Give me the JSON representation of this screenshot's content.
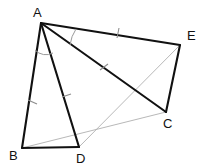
{
  "figure": {
    "width": 205,
    "height": 168,
    "background_color": "#ffffff"
  },
  "style": {
    "main_stroke_color": "#111111",
    "aux_stroke_color": "#b0b0b0",
    "tick_color": "#8d8d8d",
    "arc_color": "#9a9a9a",
    "label_color": "#111111"
  },
  "vertices": [
    {
      "id": "A",
      "label": "A",
      "x": 41,
      "y": 23,
      "label_x": 33,
      "label_y": 17
    },
    {
      "id": "B",
      "label": "B",
      "x": 22,
      "y": 148,
      "label_x": 9,
      "label_y": 160
    },
    {
      "id": "D",
      "label": "D",
      "x": 79,
      "y": 147,
      "label_x": 76,
      "label_y": 163
    },
    {
      "id": "C",
      "label": "C",
      "x": 166,
      "y": 112,
      "label_x": 163,
      "label_y": 128
    },
    {
      "id": "E",
      "label": "E",
      "x": 180,
      "y": 45,
      "label_x": 187,
      "label_y": 40
    }
  ],
  "segments_main": [
    {
      "id": "AB",
      "from": "A",
      "to": "B",
      "x1": 41,
      "y1": 23,
      "x2": 22,
      "y2": 148
    },
    {
      "id": "AD",
      "from": "A",
      "to": "D",
      "x1": 41,
      "y1": 23,
      "x2": 79,
      "y2": 147
    },
    {
      "id": "BD",
      "from": "B",
      "to": "D",
      "x1": 22,
      "y1": 148,
      "x2": 79,
      "y2": 147
    },
    {
      "id": "AE",
      "from": "A",
      "to": "E",
      "x1": 41,
      "y1": 23,
      "x2": 180,
      "y2": 45
    },
    {
      "id": "AC",
      "from": "A",
      "to": "C",
      "x1": 41,
      "y1": 23,
      "x2": 166,
      "y2": 112
    },
    {
      "id": "EC",
      "from": "E",
      "to": "C",
      "x1": 180,
      "y1": 45,
      "x2": 166,
      "y2": 112
    }
  ],
  "segments_auxiliary": [
    {
      "id": "BC",
      "from": "B",
      "to": "C",
      "x1": 22,
      "y1": 148,
      "x2": 166,
      "y2": 112
    },
    {
      "id": "DE",
      "from": "D",
      "to": "E",
      "x1": 79,
      "y1": 147,
      "x2": 180,
      "y2": 45
    }
  ],
  "tick_marks": [
    {
      "id": "tick-AB",
      "on": "AB",
      "x1": 28,
      "y1": 100,
      "x2": 37,
      "y2": 104
    },
    {
      "id": "tick-AD",
      "on": "AD",
      "x1": 62,
      "y1": 97,
      "x2": 71,
      "y2": 94
    },
    {
      "id": "tick-AE",
      "on": "AE",
      "x1": 119,
      "y1": 28,
      "x2": 117,
      "y2": 38
    },
    {
      "id": "tick-AC",
      "on": "AC",
      "x1": 100,
      "y1": 70,
      "x2": 108,
      "y2": 64
    }
  ],
  "angle_arcs": [
    {
      "id": "arc-BAD",
      "at": "A",
      "between": [
        "AB",
        "AD"
      ],
      "path": "M 35 50 A 15 15 0 0 0 53 53"
    },
    {
      "id": "arc-EAC",
      "at": "A",
      "between": [
        "AE",
        "AC"
      ],
      "path": "M 76 29 A 38 38 0 0 0 70 45"
    }
  ],
  "congruence_notes": {
    "equal_sides_set_1": [
      "AB",
      "AD"
    ],
    "equal_sides_set_2": [
      "AE",
      "AC"
    ],
    "equal_angles": [
      "BAD",
      "EAC"
    ]
  }
}
